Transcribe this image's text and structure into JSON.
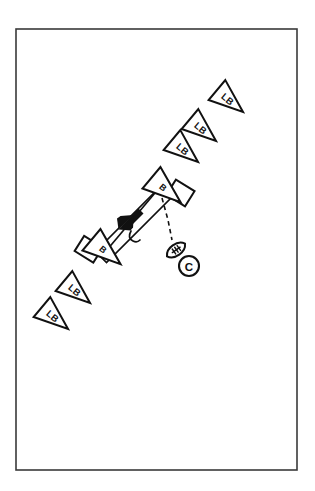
{
  "diagram": {
    "type": "football-play-diagram",
    "background_color": "#ffffff",
    "line_color": "#111111",
    "frame": {
      "name": "diagram-border",
      "x": 16,
      "y": 29,
      "width": 281,
      "height": 441,
      "stroke_color": "#3a3a3a"
    },
    "labels": {
      "linebacker": "LB",
      "blocker": "B",
      "center": "C"
    },
    "linebackers": [
      {
        "id": "lb-1",
        "label": "LB",
        "cx": 230,
        "cy": 101,
        "rotation": 40
      },
      {
        "id": "lb-2",
        "label": "LB",
        "cx": 203,
        "cy": 130,
        "rotation": 40
      },
      {
        "id": "lb-3",
        "label": "LB",
        "cx": 185,
        "cy": 151,
        "rotation": 40
      },
      {
        "id": "lb-4",
        "label": "LB",
        "cx": 77,
        "cy": 292,
        "rotation": 40
      },
      {
        "id": "lb-5",
        "label": "LB",
        "cx": 55,
        "cy": 318,
        "rotation": 40
      }
    ],
    "blockers": [
      {
        "id": "b-top",
        "label": "B",
        "cx": 166,
        "cy": 190,
        "rotation": 40,
        "shield": "blocking-shield"
      },
      {
        "id": "b-bottom",
        "label": "B",
        "cx": 106,
        "cy": 252,
        "rotation": 40,
        "shield": "blocking-shield"
      }
    ],
    "band": {
      "name": "movement-band",
      "description": "outlined band connecting the two blockers with directional arrow",
      "from": {
        "x": 162,
        "y": 193
      },
      "to": {
        "x": 105,
        "y": 252
      }
    },
    "arrow": {
      "name": "direction-arrow",
      "direction": "down-left",
      "tip": {
        "x": 125,
        "y": 222
      }
    },
    "ball": {
      "name": "football",
      "cx": 176,
      "cy": 250,
      "rotation": -35
    },
    "center_player": {
      "name": "center-marker",
      "label": "C",
      "cx": 189,
      "cy": 266,
      "r": 10
    },
    "dashed_path": {
      "name": "snap-path",
      "from": {
        "x": 163,
        "y": 199
      },
      "to": {
        "x": 172,
        "y": 241
      },
      "style": "dashed"
    }
  }
}
